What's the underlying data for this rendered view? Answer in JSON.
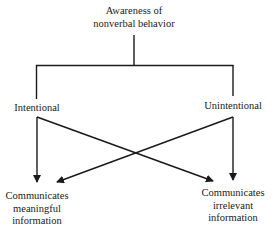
{
  "diagram": {
    "root": {
      "lines": [
        "Awareness of",
        "nonverbal behavior"
      ]
    },
    "branches": {
      "left": "Intentional",
      "right": "Unintentional"
    },
    "outcomes": {
      "left": [
        "Communicates",
        "meaningful",
        "information"
      ],
      "right": [
        "Communicates",
        "irrelevant",
        "information"
      ]
    },
    "edges": [
      {
        "from": "Awareness of nonverbal behavior",
        "to": "Intentional"
      },
      {
        "from": "Awareness of nonverbal behavior",
        "to": "Unintentional"
      },
      {
        "from": "Intentional",
        "to": "Communicates meaningful information"
      },
      {
        "from": "Intentional",
        "to": "Communicates irrelevant information"
      },
      {
        "from": "Unintentional",
        "to": "Communicates meaningful information"
      },
      {
        "from": "Unintentional",
        "to": "Communicates irrelevant information"
      }
    ],
    "line_color": "#1a1a1a"
  }
}
